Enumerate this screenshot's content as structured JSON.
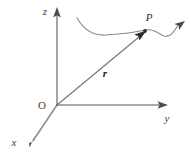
{
  "figure": {
    "background_color": "#ffffff",
    "line_color": "#8a8a8a",
    "dark_line_color": "#555555",
    "text_color": "#3f3f3f",
    "width": 191,
    "height": 157
  },
  "axes": {
    "z": {
      "label": "z",
      "label_x": 45,
      "label_y": 15,
      "line": {
        "x1": 57,
        "y1": 14,
        "x2": 57,
        "y2": 105
      },
      "arrow_tip": {
        "x": 57,
        "y": 8
      }
    },
    "y": {
      "label": "y",
      "label_x": 167,
      "label_y": 122,
      "line": {
        "x1": 57,
        "y1": 105,
        "x2": 161,
        "y2": 105
      },
      "arrow_tip": {
        "x": 168,
        "y": 105
      }
    },
    "x": {
      "label": "x",
      "label_x": 12,
      "label_y": 146,
      "line": {
        "x1": 57,
        "y1": 105,
        "x2": 33,
        "y2": 141
      },
      "arrow_tip": {
        "x": 29,
        "y": 148
      }
    }
  },
  "origin": {
    "label": "O",
    "label_x": 40,
    "label_y": 108,
    "x": 57,
    "y": 105
  },
  "point": {
    "label": "P",
    "label_x": 146,
    "label_y": 21,
    "x": 145,
    "y": 31
  },
  "vector": {
    "label": "r",
    "label_x": 103,
    "label_y": 76,
    "line": {
      "x1": 57,
      "y1": 105,
      "x2": 140,
      "y2": 36
    },
    "arrow_tip": {
      "x": 146,
      "y": 31
    },
    "name": "position-vector"
  },
  "trajectory": {
    "name": "particle-path-curve",
    "path": "M 77,18 C 84,30 93,36 106,35 C 122,34 133,33 145,30 C 154,28 159,34 164,36 C 170,38 174,32 178,25",
    "arrow_tip": {
      "x": 184,
      "y": 22
    }
  }
}
